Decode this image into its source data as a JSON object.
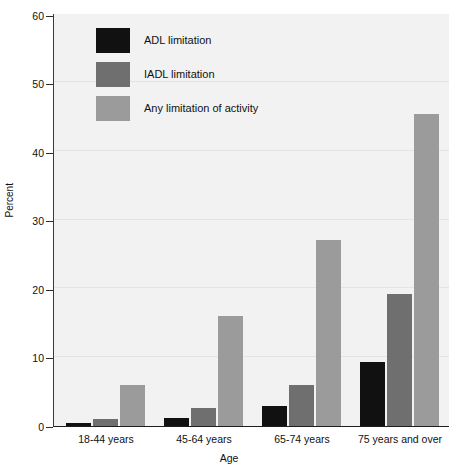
{
  "chart_data": {
    "type": "bar",
    "title": "",
    "xlabel": "Age",
    "ylabel": "Percent",
    "ylim": [
      0,
      60
    ],
    "yticks": [
      0,
      10,
      20,
      30,
      40,
      50,
      60
    ],
    "grid": true,
    "legend_position": "upper-left-inside",
    "categories": [
      "18-44 years",
      "45-64 years",
      "65-74 years",
      "75 years and over"
    ],
    "series": [
      {
        "name": "ADL limitation",
        "color": "#111111",
        "values": [
          0.5,
          1.2,
          2.9,
          9.3
        ]
      },
      {
        "name": "IADL limitation",
        "color": "#6f6f6f",
        "values": [
          1.0,
          2.6,
          5.9,
          19.2
        ]
      },
      {
        "name": "Any limitation of activity",
        "color": "#9b9b9b",
        "values": [
          6.0,
          16.0,
          27.0,
          45.4
        ]
      }
    ]
  },
  "axis": {
    "y_title": "Percent",
    "x_title": "Age",
    "y_tick_labels": [
      "0",
      "10",
      "20",
      "30",
      "40",
      "50",
      "60"
    ],
    "x_tick_labels": [
      "18-44 years",
      "45-64 years",
      "65-74 years",
      "75 years and over"
    ]
  },
  "legend": {
    "items": [
      {
        "label": "ADL limitation",
        "color": "#111111"
      },
      {
        "label": "IADL limitation",
        "color": "#6f6f6f"
      },
      {
        "label": "Any limitation of activity",
        "color": "#9b9b9b"
      }
    ]
  },
  "colors": {
    "plot_background": "#f2f2f2",
    "page_background": "#ffffff",
    "axis": "#1d1d1d",
    "gridline": "#e3e3e3",
    "text": "#111111"
  }
}
